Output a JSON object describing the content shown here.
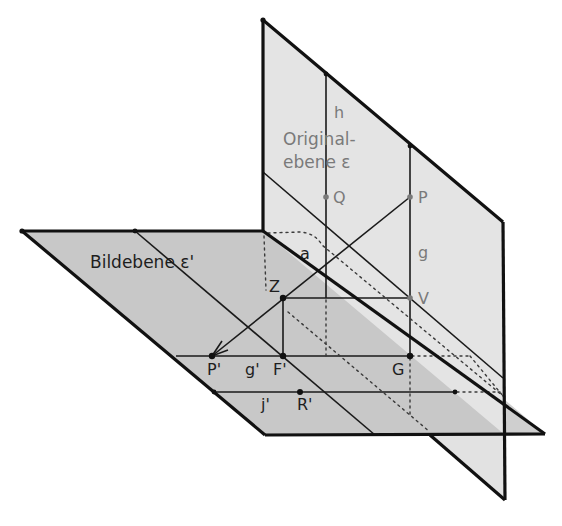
{
  "diagram": {
    "colors": {
      "ground_plane_fill": "#c4c4c4",
      "vertical_plane_fill": "#e2e2e2",
      "line": "#1a1a1a",
      "gray_label": "#7a7a7a",
      "dark_label": "#1e1e1e"
    },
    "planes": {
      "image_plane_label": "Bildebene ε'",
      "original_plane_label_line1": "Original-",
      "original_plane_label_line2": "ebene ε"
    },
    "labels": {
      "h": "h",
      "Q": "Q",
      "P": "P",
      "g": "g",
      "V": "V",
      "a": "a",
      "Z": "Z",
      "P_prime": "P'",
      "g_prime": "g'",
      "F_prime": "F'",
      "G": "G",
      "j_prime": "j'",
      "R_prime": "R'"
    }
  }
}
